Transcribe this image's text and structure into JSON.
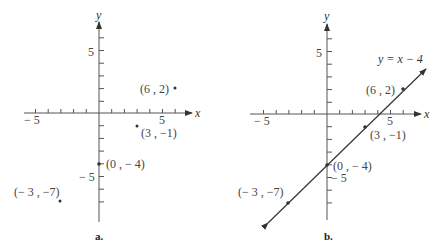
{
  "panels": [
    {
      "id": "a",
      "caption": "a.",
      "axis_x_label": "x",
      "axis_y_label": "y",
      "tick_labels": {
        "x_neg": "− 5",
        "x_pos": "5",
        "y_pos": "5",
        "y_neg": "− 5"
      },
      "points": [
        {
          "label": "(6 , 2)",
          "x": 6,
          "y": 2
        },
        {
          "label": "(3 , −1)",
          "x": 3,
          "y": -1
        },
        {
          "label": "(0 , − 4)",
          "x": 0,
          "y": -4
        },
        {
          "label": "(− 3 , −7)",
          "x": -3,
          "y": -7
        }
      ]
    },
    {
      "id": "b",
      "caption": "b.",
      "axis_x_label": "x",
      "axis_y_label": "y",
      "tick_labels": {
        "x_neg": "− 5",
        "x_pos": "5",
        "y_pos": "5",
        "y_neg": "− 5"
      },
      "line_label": "y = x − 4",
      "points": [
        {
          "label": "(6 , 2)",
          "x": 6,
          "y": 2
        },
        {
          "label": "(3 , −1)",
          "x": 3,
          "y": -1
        },
        {
          "label": "(0 , − 4)",
          "x": 0,
          "y": -4
        },
        {
          "label": "(− 3 , −7)",
          "x": -3,
          "y": -7
        }
      ]
    }
  ]
}
